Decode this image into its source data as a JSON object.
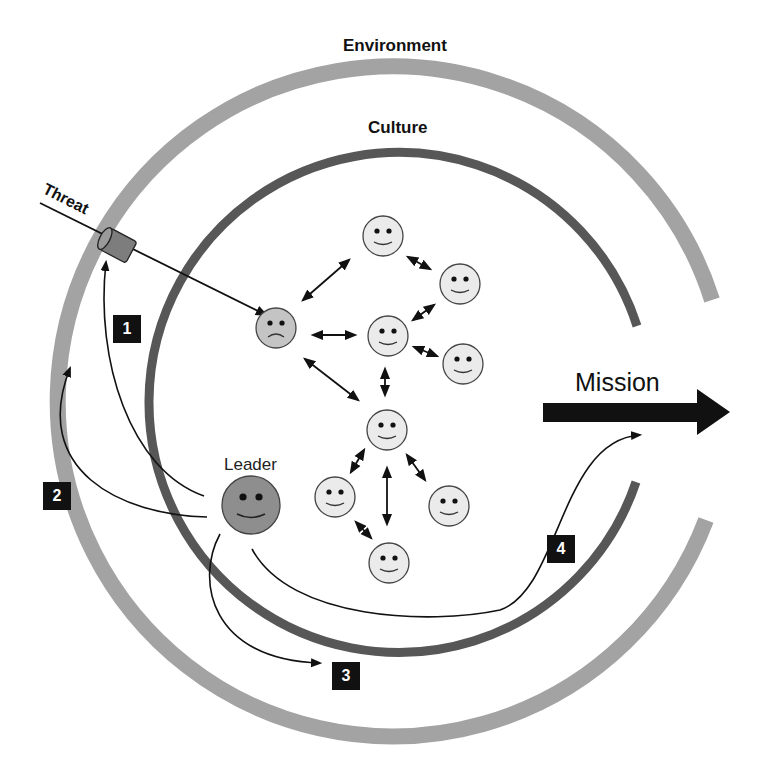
{
  "labels": {
    "environment": "Environment",
    "culture": "Culture",
    "threat": "Threat",
    "leader": "Leader",
    "mission": "Mission"
  },
  "steps": [
    {
      "number": "1"
    },
    {
      "number": "2"
    },
    {
      "number": "3"
    },
    {
      "number": "4"
    }
  ],
  "colors": {
    "environment_ring": "#a3a3a3",
    "culture_ring": "#575757",
    "face_fill": "#ebebeb",
    "sad_face_fill": "#c4c4c4",
    "leader_face_fill": "#8e8e8e",
    "arrow": "#111111",
    "step_badge": "#111111"
  },
  "nodes": [
    {
      "id": "member-top",
      "mood": "happy"
    },
    {
      "id": "member-upper-right",
      "mood": "happy"
    },
    {
      "id": "member-threatened",
      "mood": "sad"
    },
    {
      "id": "member-center",
      "mood": "happy"
    },
    {
      "id": "member-right",
      "mood": "happy"
    },
    {
      "id": "member-hub",
      "mood": "happy"
    },
    {
      "id": "member-lower-left",
      "mood": "happy"
    },
    {
      "id": "member-lower-right",
      "mood": "happy"
    },
    {
      "id": "member-bottom",
      "mood": "happy"
    },
    {
      "id": "leader",
      "mood": "happy"
    }
  ]
}
